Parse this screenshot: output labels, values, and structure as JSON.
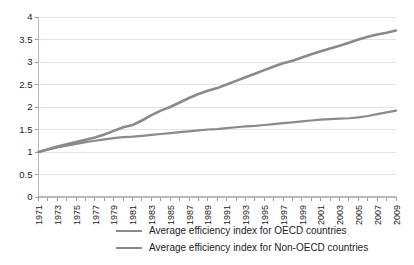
{
  "chart_data": {
    "type": "line",
    "title": "",
    "xlabel": "",
    "ylabel": "",
    "ylim": [
      0,
      4
    ],
    "ytick_values": [
      0,
      0.5,
      1,
      1.5,
      2,
      2.5,
      3,
      3.5,
      4
    ],
    "ytick_labels": [
      "0",
      "0.5",
      "1",
      "1.5",
      "2",
      "2.5",
      "3",
      "3.5",
      "4"
    ],
    "grid": true,
    "grid_axis": "y",
    "legend_position": "bottom",
    "x": [
      1971,
      1972,
      1973,
      1974,
      1975,
      1976,
      1977,
      1978,
      1979,
      1980,
      1981,
      1982,
      1983,
      1984,
      1985,
      1986,
      1987,
      1988,
      1989,
      1990,
      1991,
      1992,
      1993,
      1994,
      1995,
      1996,
      1997,
      1998,
      1999,
      2000,
      2001,
      2002,
      2003,
      2004,
      2005,
      2006,
      2007,
      2008,
      2009
    ],
    "xtick_labels": [
      "1971",
      "1973",
      "1975",
      "1977",
      "1979",
      "1981",
      "1983",
      "1985",
      "1987",
      "1989",
      "1991",
      "1993",
      "1995",
      "1997",
      "1999",
      "2001",
      "2003",
      "2005",
      "2007",
      "2009"
    ],
    "xtick_values": [
      1971,
      1973,
      1975,
      1977,
      1979,
      1981,
      1983,
      1985,
      1987,
      1989,
      1991,
      1993,
      1995,
      1997,
      1999,
      2001,
      2003,
      2005,
      2007,
      2009
    ],
    "series": [
      {
        "name": "Average efficiency index for OECD countries",
        "color": "#8a8a8e",
        "width": 2.2,
        "values": [
          1.0,
          1.05,
          1.1,
          1.14,
          1.18,
          1.22,
          1.25,
          1.28,
          1.31,
          1.33,
          1.34,
          1.36,
          1.38,
          1.4,
          1.42,
          1.44,
          1.46,
          1.48,
          1.5,
          1.51,
          1.53,
          1.55,
          1.57,
          1.58,
          1.6,
          1.62,
          1.64,
          1.66,
          1.68,
          1.7,
          1.72,
          1.73,
          1.74,
          1.75,
          1.77,
          1.8,
          1.84,
          1.88,
          1.92
        ]
      },
      {
        "name": "Average efficiency index for Non-OECD countries",
        "color": "#8a8a8e",
        "width": 2.6,
        "values": [
          1.0,
          1.06,
          1.12,
          1.17,
          1.22,
          1.27,
          1.32,
          1.39,
          1.47,
          1.55,
          1.6,
          1.7,
          1.82,
          1.92,
          2.0,
          2.1,
          2.2,
          2.29,
          2.36,
          2.42,
          2.5,
          2.58,
          2.66,
          2.74,
          2.82,
          2.9,
          2.97,
          3.03,
          3.1,
          3.17,
          3.24,
          3.3,
          3.36,
          3.43,
          3.5,
          3.56,
          3.61,
          3.65,
          3.7
        ]
      }
    ]
  },
  "legend": {
    "items": [
      {
        "label": "Average efficiency index for OECD countries"
      },
      {
        "label": "Average efficiency index for Non-OECD countries"
      }
    ]
  }
}
